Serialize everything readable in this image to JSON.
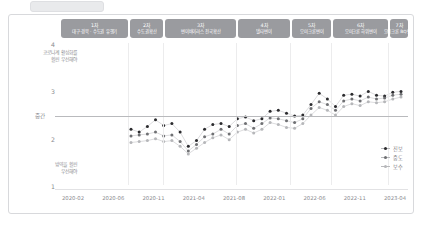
{
  "top_stub": {
    "name": "tab-stub"
  },
  "axis_notes": {
    "top_left_line1": "코로나계 활성화를",
    "top_left_line2": "훨씬 우선해야",
    "bottom_left_line1": "방역을 훨씬",
    "bottom_left_line2": "우선해야",
    "mid_label": "중간"
  },
  "colors": {
    "badge_bg": "#9a9b9f",
    "grid": "#ececed",
    "midline": "#b9babd",
    "series_dark": "#2b2b2e",
    "series_mid": "#6f7073",
    "series_light": "#b6b7ba",
    "line": "#b8b9bc",
    "text": "#8a8b8f"
  },
  "badges": [
    {
      "num": "1차",
      "desc": "대구·경북 · 수도권 유행기"
    },
    {
      "num": "2차",
      "desc": "수도권확산"
    },
    {
      "num": "3차",
      "desc": "변이바이러스 전국확산"
    },
    {
      "num": "4차",
      "desc": "델타변이"
    },
    {
      "num": "5차",
      "desc": "오미크론변이"
    },
    {
      "num": "6차",
      "desc": "오미크론 하위변이"
    },
    {
      "num": "7차",
      "desc": "오미크론 BQ변이"
    }
  ],
  "chart_data": {
    "type": "line",
    "title": "",
    "xlabel": "",
    "ylabel": "",
    "ylim": [
      1,
      4
    ],
    "yticks": [
      "4",
      "3",
      "2",
      "1"
    ],
    "ytick_values": [
      4,
      3,
      2,
      1
    ],
    "grid": false,
    "legend_position": "right",
    "reference_line": {
      "label": "중간",
      "value": 2.5
    },
    "xticks": [
      "2020-02",
      "2020-06",
      "2020-11",
      "2021-04",
      "2021-08",
      "2022-01",
      "2022-06",
      "2022-11",
      "2023-04"
    ],
    "x": [
      "2020-08",
      "2020-09",
      "2020-10",
      "2020-11",
      "2020-12",
      "2021-01",
      "2021-02",
      "2021-03",
      "2021-04",
      "2021-05",
      "2021-06",
      "2021-07",
      "2021-08",
      "2021-09",
      "2021-10",
      "2021-11",
      "2021-12",
      "2022-01",
      "2022-02",
      "2022-03",
      "2022-04",
      "2022-05",
      "2022-06",
      "2022-07",
      "2022-08",
      "2022-09",
      "2022-10",
      "2022-11",
      "2022-12",
      "2023-01",
      "2023-02",
      "2023-03",
      "2023-04",
      "2023-05"
    ],
    "series": [
      {
        "name": "진보",
        "color": "#2b2b2e",
        "values": [
          2.22,
          2.16,
          2.28,
          2.42,
          2.3,
          2.34,
          2.16,
          1.86,
          1.98,
          2.22,
          2.32,
          2.34,
          2.28,
          2.44,
          2.48,
          2.4,
          2.44,
          2.6,
          2.62,
          2.56,
          2.5,
          2.52,
          2.74,
          2.98,
          2.86,
          2.7,
          2.94,
          2.96,
          2.92,
          3.02,
          2.94,
          2.92,
          3.0,
          3.02
        ]
      },
      {
        "name": "중도",
        "color": "#6f7073",
        "values": [
          2.08,
          2.1,
          2.12,
          2.16,
          2.08,
          2.1,
          1.96,
          1.76,
          1.9,
          2.06,
          2.12,
          2.22,
          2.12,
          2.3,
          2.34,
          2.24,
          2.34,
          2.46,
          2.44,
          2.4,
          2.36,
          2.44,
          2.66,
          2.8,
          2.74,
          2.62,
          2.82,
          2.86,
          2.82,
          2.9,
          2.86,
          2.88,
          2.94,
          2.96
        ]
      },
      {
        "name": "보수",
        "color": "#b6b7ba",
        "values": [
          1.94,
          1.96,
          1.98,
          2.02,
          1.96,
          1.98,
          1.86,
          1.7,
          1.82,
          1.94,
          2.04,
          2.1,
          2.0,
          2.16,
          2.22,
          2.14,
          2.22,
          2.36,
          2.32,
          2.26,
          2.24,
          2.34,
          2.52,
          2.68,
          2.62,
          2.52,
          2.7,
          2.76,
          2.72,
          2.8,
          2.78,
          2.8,
          2.86,
          2.9
        ]
      }
    ]
  }
}
